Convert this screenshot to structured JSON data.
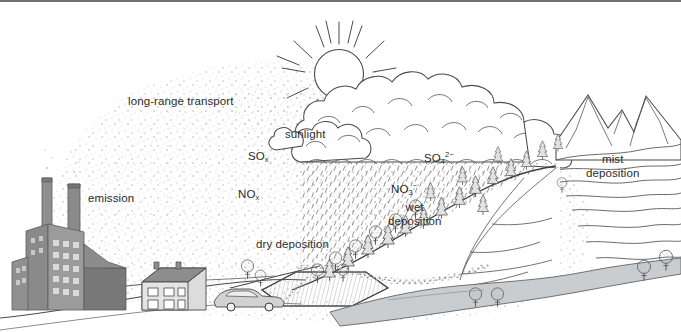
{
  "figure": {
    "domain": "diagram",
    "title_visible": false,
    "background": "#ffffff",
    "border_color": "#6e7276",
    "text_color": "#2b2b2b",
    "width": 681,
    "height": 332
  },
  "labels": [
    {
      "id": "long-range-transport",
      "text": "long-range transport",
      "x": 128,
      "y": 95
    },
    {
      "id": "emission",
      "text": "emission",
      "x": 88,
      "y": 192
    },
    {
      "id": "sunlight",
      "text": "sunlight",
      "x": 285,
      "y": 128
    },
    {
      "id": "sox",
      "html": "SO<sub>x</sub>",
      "text": "SOx",
      "x": 248,
      "y": 150
    },
    {
      "id": "nox",
      "html": "NO<sub>x</sub>",
      "text": "NOx",
      "x": 238,
      "y": 188
    },
    {
      "id": "dry-deposition",
      "text": "dry deposition",
      "x": 256,
      "y": 238
    },
    {
      "id": "sulphate",
      "html": "SO<sub>4</sub><sup>2&minus;</sup>",
      "text": "SO42-",
      "x": 424,
      "y": 152
    },
    {
      "id": "nitrate",
      "html": "NO<sub>3</sub><sup>&minus;</sup>",
      "text": "NO3-",
      "x": 391,
      "y": 183
    },
    {
      "id": "wet-deposition",
      "text": "wet\ndeposition",
      "line1": "wet",
      "line2": "deposition",
      "x": 396,
      "y": 201
    },
    {
      "id": "mist-deposition",
      "text": "mist\ndeposition",
      "line1": "mist",
      "line2": "deposition",
      "x": 598,
      "y": 153
    }
  ],
  "palette": {
    "ink": "#3a3a3a",
    "ink_light": "#6b6b6b",
    "plume_dot": "#b9b9b9",
    "rain_tick": "#8e8e8e",
    "factory_dark": "#7e7e7e",
    "factory_mid": "#8f8f8f",
    "factory_light": "#b4b4b4",
    "window": "#d9d9d9",
    "roof": "#8a8a8a",
    "house_wall": "#d8d8d8",
    "car_body": "#cfcfcf",
    "water": "#c9cdd0",
    "field_fill": "#e6e6e6",
    "tree_fill": "#d6d6d6"
  },
  "scene_elements": [
    {
      "id": "smokestack-left",
      "kind": "chimney"
    },
    {
      "id": "smokestack-right",
      "kind": "chimney"
    },
    {
      "id": "factory-block",
      "kind": "building"
    },
    {
      "id": "factory-annex",
      "kind": "building"
    },
    {
      "id": "factory-shed",
      "kind": "building"
    },
    {
      "id": "house",
      "kind": "building"
    },
    {
      "id": "car",
      "kind": "vehicle"
    },
    {
      "id": "sun",
      "kind": "sun"
    },
    {
      "id": "cloud-bank",
      "kind": "cloud"
    },
    {
      "id": "rain-shaft",
      "kind": "precipitation"
    },
    {
      "id": "pollution-plume",
      "kind": "aerosol"
    },
    {
      "id": "mountain-range",
      "kind": "terrain"
    },
    {
      "id": "hillside",
      "kind": "terrain"
    },
    {
      "id": "farm-field",
      "kind": "terrain"
    },
    {
      "id": "river",
      "kind": "water"
    },
    {
      "id": "conifer-forest",
      "kind": "vegetation"
    },
    {
      "id": "deciduous-trees",
      "kind": "vegetation"
    },
    {
      "id": "hedgerow",
      "kind": "vegetation"
    }
  ]
}
